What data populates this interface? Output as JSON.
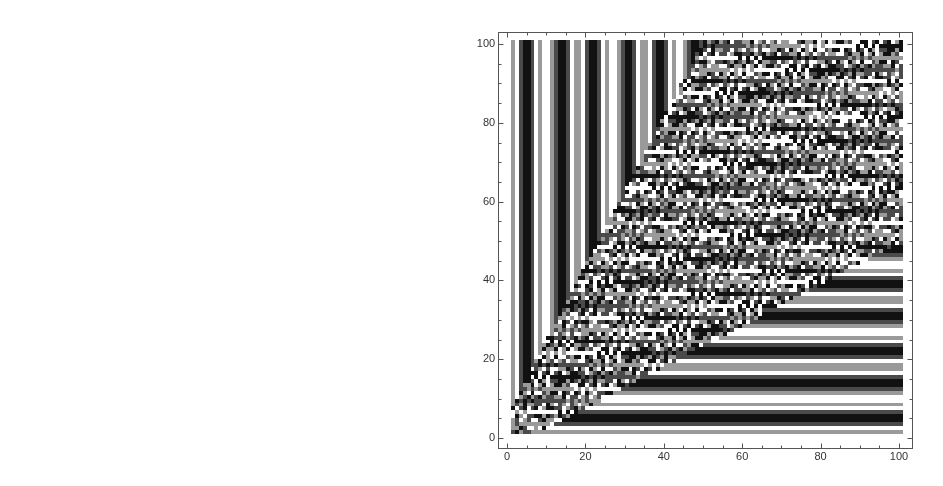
{
  "chart_data": [
    {
      "type": "heatmap",
      "title": "",
      "xlabel": "",
      "ylabel": "",
      "description": "Cellular automaton rendered as grid of grey-level cells; nested L-shaped stripes",
      "xlim": [
        0,
        51
      ],
      "ylim": [
        0,
        51
      ],
      "x_ticks": [
        "0",
        "10",
        "20",
        "30",
        "40",
        "50"
      ],
      "y_ticks": [
        "0",
        "10",
        "20",
        "30",
        "40",
        "50"
      ],
      "grid": false,
      "colors": {
        "white": "#ffffff",
        "grey": "#6e6e6e",
        "black": "#151515"
      },
      "pattern": {
        "blocks": 9,
        "x_start": 2,
        "x_step": 5,
        "y_start": 1,
        "y_step": 6,
        "x_end": 51,
        "y_end": 51
      }
    },
    {
      "type": "heatmap",
      "title": "",
      "xlabel": "",
      "ylabel": "",
      "description": "Four-level grayscale cellular automaton; vertical stripes on left, horizontal stripes at bottom, checker-like texture in upper right beyond diagonal corner",
      "xlim": [
        0,
        101
      ],
      "ylim": [
        0,
        101
      ],
      "x_ticks": [
        "0",
        "20",
        "40",
        "60",
        "80",
        "100"
      ],
      "y_ticks": [
        "0",
        "20",
        "40",
        "60",
        "80",
        "100"
      ],
      "grid": false,
      "colors": {
        "white": "#f8f8f8",
        "light": "#9a9a9a",
        "dark": "#4a4a4a",
        "black": "#111111"
      },
      "pattern": {
        "x_start": 1,
        "y_start": 1,
        "x_end": 101,
        "y_end": 101
      }
    }
  ],
  "left_plot": {
    "x_ticks": [
      {
        "v": 0,
        "label": "0"
      },
      {
        "v": 10,
        "label": "10"
      },
      {
        "v": 20,
        "label": "20"
      },
      {
        "v": 30,
        "label": "30"
      },
      {
        "v": 40,
        "label": "40"
      },
      {
        "v": 50,
        "label": "50"
      }
    ],
    "y_ticks": [
      {
        "v": 0,
        "label": "0"
      },
      {
        "v": 10,
        "label": "10"
      },
      {
        "v": 20,
        "label": "20"
      },
      {
        "v": 30,
        "label": "30"
      },
      {
        "v": 40,
        "label": "40"
      },
      {
        "v": 50,
        "label": "50"
      }
    ]
  },
  "right_plot": {
    "x_ticks": [
      {
        "v": 0,
        "label": "0"
      },
      {
        "v": 20,
        "label": "20"
      },
      {
        "v": 40,
        "label": "40"
      },
      {
        "v": 60,
        "label": "60"
      },
      {
        "v": 80,
        "label": "80"
      },
      {
        "v": 100,
        "label": "100"
      }
    ],
    "y_ticks": [
      {
        "v": 0,
        "label": "0"
      },
      {
        "v": 20,
        "label": "20"
      },
      {
        "v": 40,
        "label": "40"
      },
      {
        "v": 60,
        "label": "60"
      },
      {
        "v": 80,
        "label": "80"
      },
      {
        "v": 100,
        "label": "100"
      }
    ]
  }
}
